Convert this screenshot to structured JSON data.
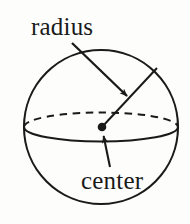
{
  "figure": {
    "type": "geometry-diagram",
    "background_color": "#fdfdfc",
    "stroke_color": "#1a1a1a",
    "labels": {
      "radius": "radius",
      "center": "center"
    },
    "shapes": {
      "sphere_outline": {
        "name": "sphere-circle",
        "cx": 101,
        "cy": 127,
        "r": 77
      },
      "equator_front": {
        "name": "equator-front-arc",
        "style": "solid",
        "rx": 77,
        "ry": 14
      },
      "equator_back": {
        "name": "equator-back-arc",
        "style": "dashed",
        "rx": 77,
        "ry": 14
      },
      "center_dot": {
        "name": "center-point",
        "cx": 102,
        "cy": 127,
        "r": 4
      },
      "radius_segment": {
        "name": "radius-line",
        "x1": 102,
        "y1": 127,
        "x2": 157,
        "y2": 68
      },
      "radius_arrow": {
        "name": "radius-leader-arrow",
        "x1": 72,
        "y1": 43,
        "x2": 129,
        "y2": 98
      },
      "center_arrow": {
        "name": "center-leader-arrow",
        "x1": 110,
        "y1": 167,
        "x2": 103,
        "y2": 134
      }
    }
  }
}
